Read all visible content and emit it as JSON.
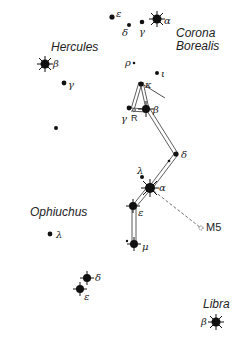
{
  "constellations": {
    "corona_borealis": "Corona\nBorealis",
    "corona_line1": "Corona",
    "corona_line2": "Borealis",
    "hercules": "Hercules",
    "ophiuchus": "Ophiuchus",
    "libra": "Libra"
  },
  "stars": {
    "cb_epsilon": "ε",
    "cb_delta": "δ",
    "cb_gamma": "γ",
    "cb_alpha": "α",
    "her_beta": "β",
    "her_gamma": "γ",
    "ser_rho": "ρ",
    "ser_iota": "ι",
    "ser_kappa": "κ",
    "ser_gamma": "γ",
    "ser_beta": "β",
    "ser_R": "R",
    "ser_delta": "δ",
    "ser_lambda": "λ",
    "ser_alpha": "α",
    "ser_epsilon": "ε",
    "ser_mu": "μ",
    "oph_lambda": "λ",
    "oph_delta": "δ",
    "oph_epsilon": "ε",
    "lib_beta": "β"
  },
  "objects": {
    "m5": "M5"
  },
  "colors": {
    "ink": "#111111",
    "background": "#ffffff"
  }
}
